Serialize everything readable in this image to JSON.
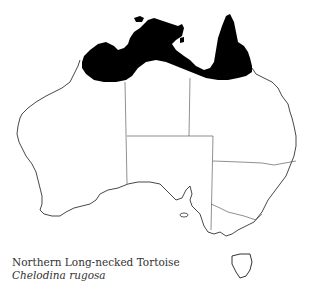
{
  "map": {
    "subject": "Australia distribution map",
    "range_fill_color": "#000000",
    "outline_color": "#333333",
    "background_color": "#ffffff",
    "range_region": "Northern Australia coastal band (Kimberley, Top End, Gulf of Carpentaria, Cape York)"
  },
  "caption": {
    "common_name": "Northern Long-necked Tortoise",
    "scientific_name": "Chelodina rugosa"
  }
}
